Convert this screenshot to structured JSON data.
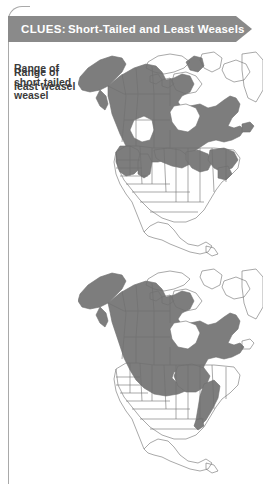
{
  "card": {
    "border_color": "#a9a9a9",
    "background": "#ffffff"
  },
  "header": {
    "prefix": "CLUES:",
    "title": "Short-Tailed and Least Weasels",
    "banner_color": "#8a8a8a",
    "text_color": "#ffffff"
  },
  "panels": [
    {
      "legend_lines": [
        "Range of",
        "short-tailed",
        "weasel"
      ],
      "map": {
        "name": "north-america-map",
        "range_fill": "#7d7d7d",
        "outline_color": "#6e6e6e",
        "land_fill": "#ffffff",
        "regions_shaded": [
          "Alaska",
          "Yukon",
          "Northwest Territories",
          "British Columbia",
          "Alberta",
          "Saskatchewan",
          "Manitoba",
          "Ontario",
          "Quebec",
          "Labrador",
          "Newfoundland",
          "Washington",
          "Oregon",
          "Idaho",
          "Montana",
          "Wyoming",
          "Utah",
          "Colorado",
          "North Dakota",
          "Minnesota",
          "Wisconsin",
          "Michigan",
          "New York",
          "New England",
          "Pennsylvania"
        ]
      }
    },
    {
      "legend_lines": [
        "Range of",
        "least weasel"
      ],
      "map": {
        "name": "north-america-map",
        "range_fill": "#7d7d7d",
        "outline_color": "#6e6e6e",
        "land_fill": "#ffffff",
        "regions_shaded": [
          "Alaska",
          "Yukon",
          "Northwest Territories",
          "British Columbia",
          "Alberta",
          "Saskatchewan",
          "Manitoba",
          "Ontario",
          "Quebec",
          "Labrador",
          "Montana",
          "North Dakota",
          "Minnesota",
          "Wisconsin",
          "Michigan",
          "Ohio",
          "Pennsylvania",
          "West Virginia",
          "Appalachians"
        ]
      }
    }
  ]
}
